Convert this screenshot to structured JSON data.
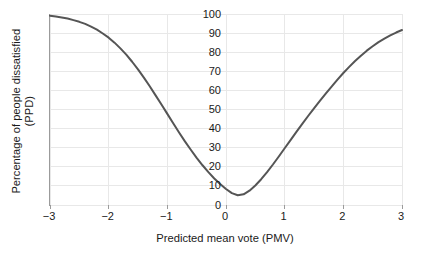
{
  "chart_data": {
    "type": "line",
    "title": "",
    "xlabel": "Predicted mean vote (PMV)",
    "ylabel_line1": "Percentage of people dissatisfied",
    "ylabel_line2": "(PPD)",
    "xlim": [
      -3,
      3
    ],
    "ylim": [
      0,
      100
    ],
    "grid": true,
    "legend": "none",
    "xticks": [
      "−3",
      "−2",
      "−1",
      "0",
      "1",
      "2",
      "3"
    ],
    "xtick_values": [
      -3,
      -2,
      -1,
      0,
      1,
      2,
      3
    ],
    "yticks": [
      "0",
      "10",
      "20",
      "30",
      "40",
      "50",
      "60",
      "70",
      "80",
      "90",
      "100"
    ],
    "ytick_values": [
      0,
      10,
      20,
      30,
      40,
      50,
      60,
      70,
      80,
      90,
      100
    ],
    "series": [
      {
        "name": "PPD",
        "color": "#555555",
        "line_width": 2,
        "x": [
          -3,
          -2.9,
          -2.8,
          -2.7,
          -2.6,
          -2.5,
          -2.4,
          -2.3,
          -2.2,
          -2.1,
          -2,
          -1.9,
          -1.8,
          -1.7,
          -1.6,
          -1.5,
          -1.4,
          -1.3,
          -1.2,
          -1.1,
          -1,
          -0.9,
          -0.8,
          -0.7,
          -0.6,
          -0.5,
          -0.4,
          -0.3,
          -0.2,
          -0.1,
          0,
          0.1,
          0.2,
          0.3,
          0.4,
          0.5,
          0.6,
          0.7,
          0.8,
          0.9,
          1,
          1.1,
          1.2,
          1.3,
          1.4,
          1.5,
          1.6,
          1.7,
          1.8,
          1.9,
          2,
          2.1,
          2.2,
          2.3,
          2.4,
          2.5,
          2.6,
          2.7,
          2.8,
          2.9,
          3
        ],
        "y": [
          99.1,
          98.7,
          98.2,
          97.6,
          96.8,
          95.9,
          94.8,
          93.4,
          91.8,
          89.8,
          87.6,
          85.0,
          82.0,
          78.7,
          75.0,
          71.0,
          66.7,
          62.2,
          57.4,
          52.6,
          47.7,
          42.8,
          38.0,
          33.3,
          28.9,
          24.7,
          20.8,
          17.2,
          13.9,
          11.0,
          8.4,
          6.2,
          5.1,
          5.6,
          7.5,
          10.2,
          13.5,
          17.2,
          21.2,
          25.4,
          29.7,
          34.0,
          38.3,
          42.5,
          46.6,
          50.6,
          54.5,
          58.3,
          62.0,
          65.6,
          69.1,
          72.3,
          75.4,
          78.2,
          80.8,
          83.1,
          85.3,
          87.1,
          88.8,
          90.3,
          91.6
        ]
      }
    ],
    "annotations": [],
    "min_point": {
      "x": 0,
      "y": 5
    },
    "colors": {
      "curve": "#555555",
      "grid": "#e8e8e8",
      "axis": "#9b9b9b",
      "text": "#1a1a1a",
      "background": "#ffffff"
    }
  }
}
